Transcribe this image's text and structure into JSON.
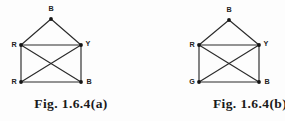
{
  "document": {
    "background_color": "#fdfdfd",
    "ink_color": "#2b2b2b"
  },
  "figures": [
    {
      "id": "figure-a",
      "caption": "Fig. 1.6.4(a)",
      "graph": {
        "type": "undirected-graph",
        "description": "Five-vertex graph: a triangle apex joined to a complete quadrilateral with both diagonals",
        "vertices": [
          {
            "id": "top",
            "label": "B",
            "x": 51,
            "y": 19,
            "label_x": 51,
            "label_y": 11,
            "label_anchor": "middle"
          },
          {
            "id": "middle-left",
            "label": "R",
            "x": 21,
            "y": 45,
            "label_x": 14,
            "label_y": 47,
            "label_anchor": "middle"
          },
          {
            "id": "middle-right",
            "label": "Y",
            "x": 81,
            "y": 45,
            "label_x": 88,
            "label_y": 46,
            "label_anchor": "middle"
          },
          {
            "id": "bottom-left",
            "label": "R",
            "x": 21,
            "y": 82,
            "label_x": 14,
            "label_y": 84,
            "label_anchor": "middle"
          },
          {
            "id": "bottom-right",
            "label": "B",
            "x": 81,
            "y": 82,
            "label_x": 89,
            "label_y": 84,
            "label_anchor": "middle"
          }
        ],
        "edges": [
          {
            "from": "top",
            "to": "middle-left"
          },
          {
            "from": "top",
            "to": "middle-right"
          },
          {
            "from": "middle-left",
            "to": "middle-right"
          },
          {
            "from": "middle-left",
            "to": "bottom-left"
          },
          {
            "from": "middle-right",
            "to": "bottom-right"
          },
          {
            "from": "bottom-left",
            "to": "bottom-right"
          },
          {
            "from": "middle-left",
            "to": "bottom-right"
          },
          {
            "from": "middle-right",
            "to": "bottom-left"
          }
        ]
      }
    },
    {
      "id": "figure-b",
      "caption": "Fig. 1.6.4(b)",
      "graph": {
        "type": "undirected-graph",
        "description": "Five-vertex graph: a triangle apex joined to a complete quadrilateral with both diagonals",
        "vertices": [
          {
            "id": "top",
            "label": "B",
            "x": 86,
            "y": 20,
            "label_x": 86,
            "label_y": 12,
            "label_anchor": "middle"
          },
          {
            "id": "middle-left",
            "label": "R",
            "x": 56,
            "y": 45,
            "label_x": 49,
            "label_y": 47,
            "label_anchor": "middle"
          },
          {
            "id": "middle-right",
            "label": "Y",
            "x": 116,
            "y": 45,
            "label_x": 123,
            "label_y": 46,
            "label_anchor": "middle"
          },
          {
            "id": "bottom-left",
            "label": "G",
            "x": 56,
            "y": 82,
            "label_x": 49,
            "label_y": 84,
            "label_anchor": "middle"
          },
          {
            "id": "bottom-right",
            "label": "B",
            "x": 116,
            "y": 82,
            "label_x": 124,
            "label_y": 84,
            "label_anchor": "middle"
          }
        ],
        "edges": [
          {
            "from": "top",
            "to": "middle-left"
          },
          {
            "from": "top",
            "to": "middle-right"
          },
          {
            "from": "middle-left",
            "to": "middle-right"
          },
          {
            "from": "middle-left",
            "to": "bottom-left"
          },
          {
            "from": "middle-right",
            "to": "bottom-right"
          },
          {
            "from": "bottom-left",
            "to": "bottom-right"
          },
          {
            "from": "middle-left",
            "to": "bottom-right"
          },
          {
            "from": "middle-right",
            "to": "bottom-left"
          }
        ]
      }
    }
  ]
}
